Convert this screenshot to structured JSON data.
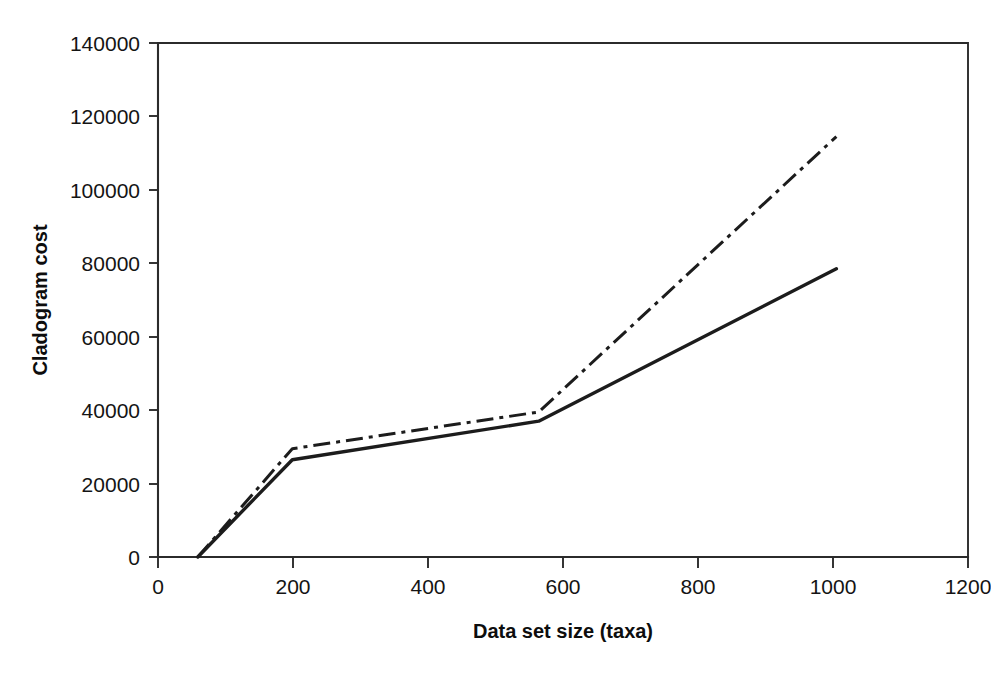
{
  "chart_data": {
    "type": "line",
    "title": "",
    "subtitle": "",
    "xlabel": "Data set size (taxa)",
    "ylabel": "Cladogram cost",
    "xlim": [
      0,
      1200
    ],
    "ylim": [
      0,
      140000
    ],
    "xticks": [
      0,
      200,
      400,
      600,
      800,
      1000,
      1200
    ],
    "yticks": [
      0,
      20000,
      40000,
      60000,
      80000,
      100000,
      120000,
      140000
    ],
    "xtick_labels": [
      "0",
      "200",
      "400",
      "600",
      "800",
      "1000",
      "1200"
    ],
    "ytick_labels": [
      "0",
      "20000",
      "40000",
      "60000",
      "80000",
      "100000",
      "120000",
      "140000"
    ],
    "grid": false,
    "legend": "none",
    "series": [
      {
        "name": "solid-series",
        "style": "solid",
        "color": "#1c1c1c",
        "x": [
          59,
          199,
          564,
          1005
        ],
        "values": [
          0,
          26500,
          37000,
          78500
        ]
      },
      {
        "name": "dash-dot-series",
        "style": "dash-dot",
        "color": "#1c1c1c",
        "x": [
          59,
          199,
          564,
          1005
        ],
        "values": [
          0,
          29500,
          39500,
          114500
        ]
      }
    ],
    "annotations": []
  },
  "axes": {
    "y_axis_title": "Cladogram cost",
    "x_axis_title": "Data set size (taxa)"
  }
}
